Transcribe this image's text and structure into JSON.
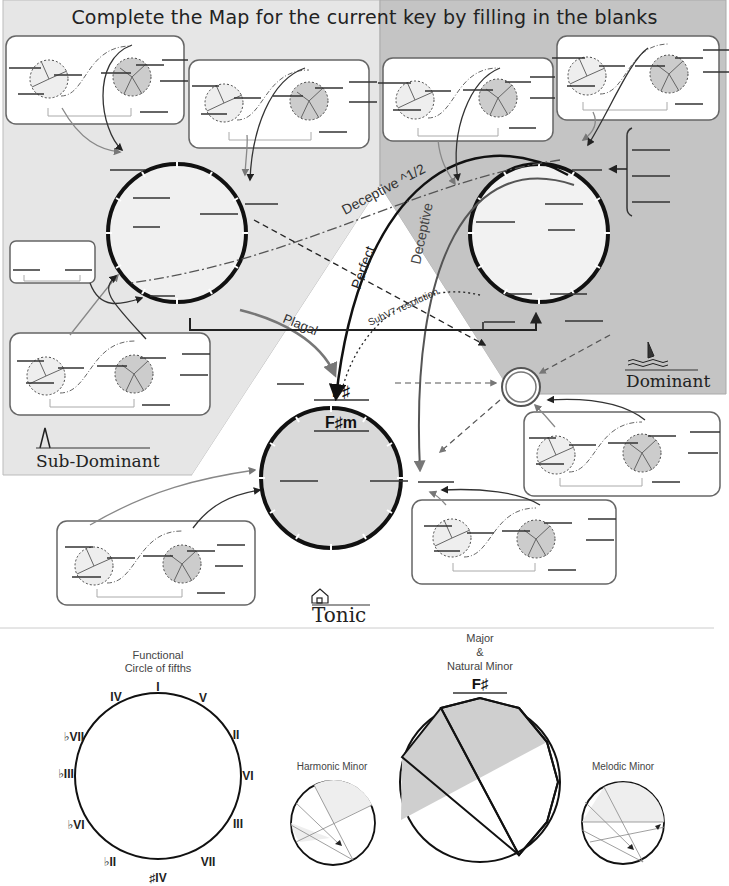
{
  "title": "Complete the Map for the current  key by filling in the blanks",
  "regions": {
    "subdominant": {
      "label": "Sub-Dominant",
      "icon": "pyramid-icon",
      "fill": "#e6e6e6"
    },
    "dominant": {
      "label": "Dominant",
      "icon": "sailboat-icon",
      "fill": "#c4c4c4"
    },
    "tonic": {
      "label": "Tonic",
      "icon": "house-icon",
      "fill": "#ffffff"
    }
  },
  "arrows": {
    "deceptive_half": "Deceptive ^1/2",
    "perfect": "Perfect",
    "deceptive": "Deceptive",
    "plagal": "Plagal",
    "subv7": "SubV7 resolution"
  },
  "tonic_circle": {
    "major_key": "F♯",
    "minor_key": "F♯m",
    "fill": "#d9d9d9"
  },
  "legend": {
    "functional_circle": {
      "title_line1": "Functional",
      "title_line2": "Circle of fifths",
      "degrees": [
        "I",
        "V",
        "II",
        "VI",
        "III",
        "VII",
        "♯IV",
        "♭II",
        "♭VI",
        "♭III",
        "♭VII",
        "IV"
      ]
    },
    "major_natural_minor": {
      "title_line1": "Major",
      "title_line2": "&",
      "title_line3": "Natural Minor",
      "key": "F♯"
    },
    "harmonic_minor": {
      "title": "Harmonic Minor"
    },
    "melodic_minor": {
      "title": "Melodic Minor"
    }
  },
  "colors": {
    "dark_shade": "#c4c4c4",
    "light_shade": "#e6e6e6",
    "line": "#111111",
    "arrow_gray": "#777777"
  }
}
